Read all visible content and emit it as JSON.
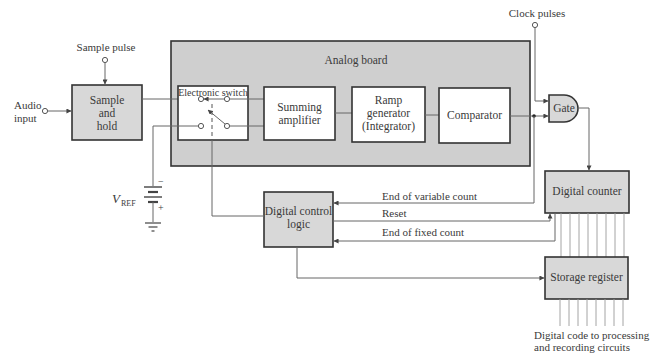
{
  "diagram": {
    "colors": {
      "block_fill_gray": "#d8d8d8",
      "block_fill_white": "#ffffff",
      "board_fill": "#cfcfcf",
      "stroke": "#333333",
      "wire": "#666666"
    },
    "inputs": {
      "audio_input": "Audio input",
      "audio_input_line1": "Audio",
      "audio_input_line2": "input",
      "sample_pulse": "Sample pulse",
      "clock_pulses": "Clock pulses"
    },
    "reference": {
      "symbol": "V",
      "subscript": "REF",
      "polarity_top": "−",
      "polarity_bottom": "+"
    },
    "analog_board": {
      "label": "Analog board",
      "switch": {
        "label": "Electronic switch"
      },
      "blocks": [
        {
          "id": "summing_amplifier",
          "lines": [
            "Summing",
            "amplifier"
          ]
        },
        {
          "id": "ramp_generator",
          "lines": [
            "Ramp",
            "generator",
            "(Integrator)"
          ]
        },
        {
          "id": "comparator",
          "lines": [
            "Comparator"
          ]
        }
      ]
    },
    "blocks": {
      "sample_and_hold": {
        "lines": [
          "Sample",
          "and",
          "hold"
        ]
      },
      "gate": {
        "label": "Gate"
      },
      "digital_counter": {
        "label": "Digital counter"
      },
      "digital_control_logic": {
        "lines": [
          "Digital control",
          "logic"
        ]
      },
      "storage_register": {
        "label": "Storage register"
      }
    },
    "signals": {
      "end_of_variable_count": "End of variable count",
      "reset": "Reset",
      "end_of_fixed_count": "End of fixed count"
    },
    "output": {
      "line1": "Digital code to processing",
      "line2": "and recording circuits",
      "bus_width": 8
    },
    "connections": [
      {
        "from": "Audio input",
        "to": "Sample and hold"
      },
      {
        "from": "Sample pulse",
        "to": "Sample and hold"
      },
      {
        "from": "Sample and hold",
        "to": "Electronic switch"
      },
      {
        "from": "V_REF",
        "to": "Electronic switch"
      },
      {
        "from": "Electronic switch",
        "to": "Summing amplifier"
      },
      {
        "from": "Summing amplifier",
        "to": "Ramp generator (Integrator)"
      },
      {
        "from": "Ramp generator (Integrator)",
        "to": "Comparator"
      },
      {
        "from": "Comparator",
        "to": "Gate"
      },
      {
        "from": "Clock pulses",
        "to": "Gate"
      },
      {
        "from": "Gate",
        "to": "Digital counter"
      },
      {
        "from": "Comparator",
        "to": "Digital control logic",
        "label": "End of variable count"
      },
      {
        "from": "Digital control logic",
        "to": "Digital counter",
        "label": "Reset"
      },
      {
        "from": "Digital counter",
        "to": "Digital control logic",
        "label": "End of fixed count"
      },
      {
        "from": "Digital control logic",
        "to": "Electronic switch"
      },
      {
        "from": "Digital control logic",
        "to": "Storage register"
      },
      {
        "from": "Digital counter",
        "to": "Storage register",
        "bus": 8
      },
      {
        "from": "Storage register",
        "to": "Digital code to processing and recording circuits",
        "bus": 8
      }
    ]
  }
}
